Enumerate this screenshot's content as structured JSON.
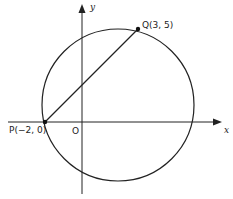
{
  "diagram": {
    "axes": {
      "x_label": "x",
      "y_label": "y",
      "origin_label": "O"
    },
    "points": [
      {
        "name": "P",
        "label": "P(−2, 0)",
        "x": -2,
        "y": 0
      },
      {
        "name": "Q",
        "label": "Q(3, 5)",
        "x": 3,
        "y": 5
      }
    ],
    "circle": {
      "description": "circle through P and Q"
    },
    "segment": {
      "from": "P",
      "to": "Q"
    }
  }
}
